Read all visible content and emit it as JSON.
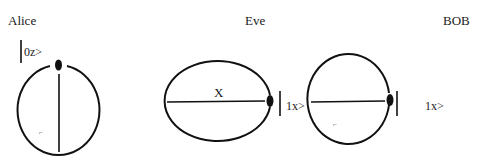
{
  "parties": {
    "alice": {
      "label": "Alice",
      "ket": "|0z>",
      "ket_text": "0z>"
    },
    "eve": {
      "label": "Eve",
      "axis_label": "X"
    },
    "bob": {
      "label": "BOB",
      "ket_between": "1x>",
      "ket_right": "1x>"
    }
  },
  "marks": {
    "alice_small": "⌐",
    "bob_small": "⌐"
  },
  "colors": {
    "stroke": "#111111",
    "background": "#ffffff"
  }
}
